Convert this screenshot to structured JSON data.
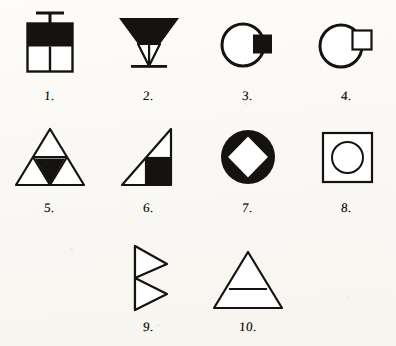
{
  "sheet": {
    "title": "Geometric Figure Test Sheet",
    "background_color": "#fbfaf7",
    "ink_color": "#151310",
    "figure_count": 10,
    "layout": {
      "rows": 3,
      "items_per_row": [
        4,
        4,
        2
      ]
    }
  },
  "figures": [
    {
      "number": "1.",
      "name": "split-square-with-t-mast",
      "description": "Square: upper half solid black, lower half divided by a vertical line into two white cells; a vertical stem with a horizontal crossbar rises from the top edge.",
      "fill": "half-black",
      "shape": "square"
    },
    {
      "number": "2.",
      "name": "funnel-inverted-triangle",
      "description": "Inverted triangle funnel: upper band solid black, lower white portion with converging inner lines meeting at the apex, resting on a horizontal base bar.",
      "fill": "upper-black",
      "shape": "inverted-triangle"
    },
    {
      "number": "3.",
      "name": "circle-with-black-square",
      "description": "Circle outline with a solid black square overlapping its right edge.",
      "fill": "black-square",
      "shape": "circle-square"
    },
    {
      "number": "4.",
      "name": "circle-with-white-square",
      "description": "Circle outline with a white outlined square overlapping its upper-right edge.",
      "fill": "white-square",
      "shape": "circle-square"
    },
    {
      "number": "5.",
      "name": "triangle-quartered-black-center",
      "description": "Equilateral triangle subdivided into four smaller triangles; the central inverted triangle is solid black.",
      "fill": "center-black",
      "shape": "triangle"
    },
    {
      "number": "6.",
      "name": "right-triangle-black-quadrant",
      "description": "Right triangle with vertical right side and horizontal base; the lower-right quarter square is solid black with a small white rectangle above it.",
      "fill": "quadrant-black",
      "shape": "right-triangle"
    },
    {
      "number": "7.",
      "name": "black-disc-white-diamond",
      "description": "Solid black disc with a white diamond (rotated square) inscribed, its vertices touching the inner edge.",
      "fill": "black-disc",
      "shape": "circle-diamond"
    },
    {
      "number": "8.",
      "name": "square-with-inscribed-circle",
      "description": "Square outline containing a circle outline; both unfilled.",
      "fill": "outline",
      "shape": "square-circle"
    },
    {
      "number": "9.",
      "name": "double-right-triangles-stacked",
      "description": "Two right-pointing triangles stacked vertically sharing a common vertical left spine.",
      "fill": "outline",
      "shape": "double-triangle"
    },
    {
      "number": "10.",
      "name": "triangle-with-horizontal-band",
      "description": "Triangle outline crossed by a single horizontal line across its lower portion.",
      "fill": "outline",
      "shape": "triangle-banded"
    }
  ]
}
